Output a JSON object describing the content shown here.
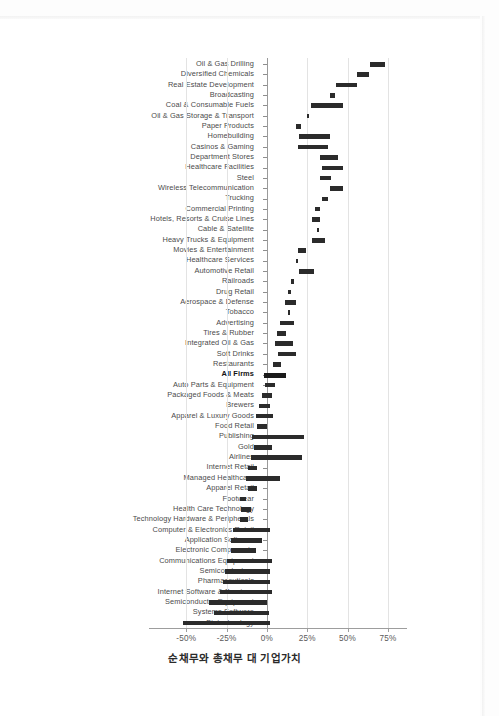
{
  "chart_data": {
    "type": "bar",
    "subtype": "floating-range-bar",
    "title": "",
    "caption": "순채무와 총채무 대 기업가치",
    "xlabel": "순채무와 총채무 대 기업가치",
    "ylabel": "",
    "xlim": [
      -57,
      80
    ],
    "grid": true,
    "legend": null,
    "xticks": [
      -50,
      -25,
      0,
      25,
      50,
      75
    ],
    "xtick_labels": [
      "-50%",
      "-25%",
      "0%",
      "25%",
      "50%",
      "75%"
    ],
    "highlight_category": "All Firms",
    "value_unit": "percent",
    "series": [
      {
        "name": "Net Debt / Enterprise Value",
        "role": "range_start"
      },
      {
        "name": "Total Debt / Enterprise Value",
        "role": "range_end"
      }
    ],
    "categories": [
      "Oil & Gas Drilling",
      "Diversified Chemicals",
      "Real Estate Development",
      "Broadcasting",
      "Coal & Consumable Fuels",
      "Oil & Gas Storage & Transport",
      "Paper Products",
      "Homebuilding",
      "Casinos & Gaming",
      "Department Stores",
      "Healthcare Facilities",
      "Steel",
      "Wireless Telecommunication",
      "Trucking",
      "Commercial Printing",
      "Hotels, Resorts & Cruise Lines",
      "Cable & Satellite",
      "Heavy Trucks & Equipment",
      "Movies & Entertainment",
      "Healthcare Services",
      "Automotive Retail",
      "Railroads",
      "Drug Retail",
      "Aerospace & Defense",
      "Tobacco",
      "Advertising",
      "Tires & Rubber",
      "Integrated Oil & Gas",
      "Soft Drinks",
      "Restaurants",
      "All Firms",
      "Auto Parts & Equipment",
      "Packaged Foods & Meats",
      "Brewers",
      "Apparel & Luxury Goods",
      "Food Retail",
      "Publishing",
      "Gold",
      "Airlines",
      "Internet Retail",
      "Managed Healthcare",
      "Apparel Retail",
      "Footwear",
      "Health Care Technology",
      "Technology Hardware & Peripherals",
      "Computer & Electronics Retail",
      "Application Software",
      "Electronic Components",
      "Communications Equipment",
      "Semiconductors",
      "Pharmaceuticals",
      "Internet Software & Services",
      "Semiconductor Equipment",
      "Systems Software",
      "Biotechnology"
    ],
    "ranges": [
      {
        "category": "Oil & Gas Drilling",
        "net_debt": 64.0,
        "total_debt": 73.0
      },
      {
        "category": "Diversified Chemicals",
        "net_debt": 56.0,
        "total_debt": 63.0
      },
      {
        "category": "Real Estate Development",
        "net_debt": 43.0,
        "total_debt": 56.0
      },
      {
        "category": "Broadcasting",
        "net_debt": 39.0,
        "total_debt": 42.0
      },
      {
        "category": "Coal & Consumable Fuels",
        "net_debt": 27.0,
        "total_debt": 47.0
      },
      {
        "category": "Oil & Gas Storage & Transport",
        "net_debt": 25.0,
        "total_debt": 26.0
      },
      {
        "category": "Paper Products",
        "net_debt": 18.0,
        "total_debt": 21.0
      },
      {
        "category": "Homebuilding",
        "net_debt": 20.0,
        "total_debt": 39.0
      },
      {
        "category": "Casinos & Gaming",
        "net_debt": 19.0,
        "total_debt": 38.0
      },
      {
        "category": "Department Stores",
        "net_debt": 33.0,
        "total_debt": 44.0
      },
      {
        "category": "Healthcare Facilities",
        "net_debt": 34.0,
        "total_debt": 47.0
      },
      {
        "category": "Steel",
        "net_debt": 33.0,
        "total_debt": 40.0
      },
      {
        "category": "Wireless Telecommunication",
        "net_debt": 39.0,
        "total_debt": 47.0
      },
      {
        "category": "Trucking",
        "net_debt": 34.0,
        "total_debt": 38.0
      },
      {
        "category": "Commercial Printing",
        "net_debt": 30.0,
        "total_debt": 33.0
      },
      {
        "category": "Hotels, Resorts & Cruise Lines",
        "net_debt": 28.0,
        "total_debt": 33.0
      },
      {
        "category": "Cable & Satellite",
        "net_debt": 31.0,
        "total_debt": 32.0
      },
      {
        "category": "Heavy Trucks & Equipment",
        "net_debt": 28.0,
        "total_debt": 36.0
      },
      {
        "category": "Movies & Entertainment",
        "net_debt": 19.0,
        "total_debt": 24.0
      },
      {
        "category": "Healthcare Services",
        "net_debt": 18.0,
        "total_debt": 19.0
      },
      {
        "category": "Automotive Retail",
        "net_debt": 20.0,
        "total_debt": 29.0
      },
      {
        "category": "Railroads",
        "net_debt": 15.0,
        "total_debt": 17.0
      },
      {
        "category": "Drug Retail",
        "net_debt": 13.0,
        "total_debt": 15.0
      },
      {
        "category": "Aerospace & Defense",
        "net_debt": 11.0,
        "total_debt": 18.0
      },
      {
        "category": "Tobacco",
        "net_debt": 13.0,
        "total_debt": 14.0
      },
      {
        "category": "Advertising",
        "net_debt": 8.0,
        "total_debt": 17.0
      },
      {
        "category": "Tires & Rubber",
        "net_debt": 6.0,
        "total_debt": 12.0
      },
      {
        "category": "Integrated Oil & Gas",
        "net_debt": 5.0,
        "total_debt": 16.0
      },
      {
        "category": "Soft Drinks",
        "net_debt": 7.0,
        "total_debt": 18.0
      },
      {
        "category": "Restaurants",
        "net_debt": 4.0,
        "total_debt": 9.0
      },
      {
        "category": "All Firms",
        "net_debt": -2.0,
        "total_debt": 12.0
      },
      {
        "category": "Auto Parts & Equipment",
        "net_debt": -1.0,
        "total_debt": 5.0
      },
      {
        "category": "Packaged Foods & Meats",
        "net_debt": -3.0,
        "total_debt": 3.0
      },
      {
        "category": "Brewers",
        "net_debt": -5.0,
        "total_debt": 2.0
      },
      {
        "category": "Apparel & Luxury Goods",
        "net_debt": -7.0,
        "total_debt": 4.0
      },
      {
        "category": "Food Retail",
        "net_debt": -6.0,
        "total_debt": 0.0
      },
      {
        "category": "Publishing",
        "net_debt": -9.0,
        "total_debt": 23.0
      },
      {
        "category": "Gold",
        "net_debt": -8.0,
        "total_debt": 3.0
      },
      {
        "category": "Airlines",
        "net_debt": -10.0,
        "total_debt": 22.0
      },
      {
        "category": "Internet Retail",
        "net_debt": -12.0,
        "total_debt": -6.0
      },
      {
        "category": "Managed Healthcare",
        "net_debt": -13.0,
        "total_debt": 8.0
      },
      {
        "category": "Apparel Retail",
        "net_debt": -12.0,
        "total_debt": -6.0
      },
      {
        "category": "Footwear",
        "net_debt": -17.0,
        "total_debt": -13.0
      },
      {
        "category": "Health Care Technology",
        "net_debt": -16.0,
        "total_debt": -10.0
      },
      {
        "category": "Technology Hardware & Peripherals",
        "net_debt": -17.0,
        "total_debt": -12.0
      },
      {
        "category": "Computer & Electronics Retail",
        "net_debt": -21.0,
        "total_debt": 2.0
      },
      {
        "category": "Application Software",
        "net_debt": -22.0,
        "total_debt": -3.0
      },
      {
        "category": "Electronic Components",
        "net_debt": -22.0,
        "total_debt": -7.0
      },
      {
        "category": "Communications Equipment",
        "net_debt": -25.0,
        "total_debt": 3.0
      },
      {
        "category": "Semiconductors",
        "net_debt": -26.0,
        "total_debt": 2.0
      },
      {
        "category": "Pharmaceuticals",
        "net_debt": -27.0,
        "total_debt": 2.0
      },
      {
        "category": "Internet Software & Services",
        "net_debt": -29.0,
        "total_debt": 3.0
      },
      {
        "category": "Semiconductor Equipment",
        "net_debt": -36.0,
        "total_debt": 0.0
      },
      {
        "category": "Systems Software",
        "net_debt": -33.0,
        "total_debt": 1.0
      },
      {
        "category": "Biotechnology",
        "net_debt": -52.0,
        "total_debt": 2.0
      }
    ]
  }
}
